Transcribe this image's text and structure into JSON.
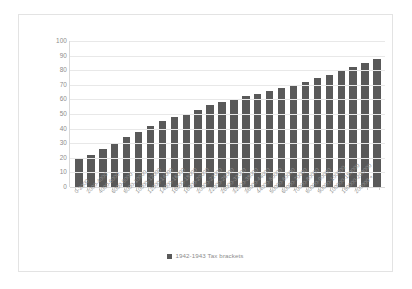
{
  "chart_data": {
    "type": "bar",
    "title": "",
    "xlabel": "",
    "ylabel": "",
    "ylim": [
      0,
      100
    ],
    "yticks": [
      0,
      10,
      20,
      30,
      40,
      50,
      60,
      70,
      80,
      90,
      100
    ],
    "grid": true,
    "legend_position": "bottom-center",
    "series": [
      {
        "name": "1942-1943 Tax brackets",
        "color": "#595959",
        "values": [
          19,
          22,
          26,
          30,
          34,
          38,
          42,
          45,
          48,
          50,
          53,
          56,
          58,
          60,
          62,
          64,
          66,
          68,
          70,
          72,
          75,
          77,
          80,
          82,
          85,
          88
        ]
      }
    ],
    "categories": [
      "0-2000",
      "2000-4000",
      "4000-6000",
      "6000-8000",
      "8000-10000",
      "10000-12000",
      "12000-14000",
      "14000-16000",
      "16000-18000",
      "18000-20000",
      "20000-22000",
      "22000-26000",
      "26000-32000",
      "32000-38000",
      "38000-44000",
      "44000-50000",
      "50000-60000",
      "60000-70000",
      "70000-80000",
      "80000-90000",
      "90000-100000",
      "100000-150000",
      "150000-200000",
      "200000 +",
      "",
      ""
    ]
  },
  "legend": {
    "label": "1942-1943 Tax brackets"
  }
}
